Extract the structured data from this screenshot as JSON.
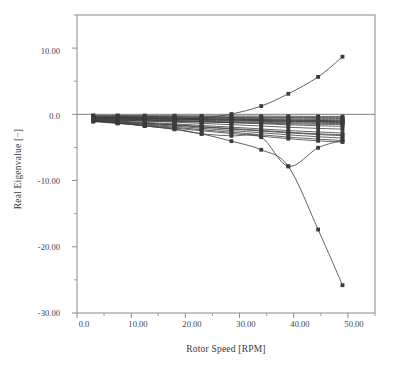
{
  "chart_data": {
    "type": "line",
    "title": "",
    "xlabel": "Rotor Speed [RPM]",
    "ylabel": "Real Eigenvalue [−]",
    "xlim": [
      0,
      55
    ],
    "ylim": [
      -30,
      15
    ],
    "grid": false,
    "legend": "none",
    "marker": "filled-square",
    "line_color": "#3b3b3b",
    "xticks": [
      0,
      10,
      20,
      30,
      40,
      50
    ],
    "xtick_labels": [
      "0.0",
      "10.00",
      "20.00",
      "30.00",
      "40.00",
      "50.00"
    ],
    "yticks": [
      10,
      0,
      -10,
      -20,
      -30
    ],
    "ytick_labels": [
      "10.00",
      "0.0",
      "-10.00",
      "-20.00",
      "-30.00"
    ],
    "minor_ytick_step": 5,
    "minor_xtick_step": 5,
    "x": [
      3,
      7.5,
      12.5,
      18,
      23,
      28.5,
      34,
      39,
      44.5,
      49
    ],
    "series": [
      {
        "name": "mode-1-unstable-branch",
        "values": [
          -0.45,
          -0.52,
          -0.6,
          -0.7,
          -0.55,
          0.05,
          1.25,
          3.1,
          5.65,
          8.7
        ]
      },
      {
        "name": "mode-2-divergent-branch",
        "values": [
          -0.95,
          -1.3,
          -1.75,
          -2.25,
          -2.95,
          -4.05,
          -5.35,
          -7.85,
          -17.4,
          -25.8
        ]
      },
      {
        "name": "mode-3-recovering-branch",
        "values": [
          -0.95,
          -1.3,
          -1.75,
          -2.25,
          -2.95,
          -3.25,
          -3.45,
          -7.85,
          -5.05,
          -3.95
        ]
      },
      {
        "name": "mode-4",
        "values": [
          -0.3,
          -0.33,
          -0.36,
          -0.4,
          -0.44,
          -0.48,
          -0.52,
          -0.56,
          -0.6,
          -0.62
        ]
      },
      {
        "name": "mode-5",
        "values": [
          -0.38,
          -0.42,
          -0.46,
          -0.5,
          -0.55,
          -0.6,
          -0.66,
          -0.72,
          -0.78,
          -0.82
        ]
      },
      {
        "name": "mode-6",
        "values": [
          -0.48,
          -0.52,
          -0.57,
          -0.62,
          -0.68,
          -0.74,
          -0.8,
          -0.87,
          -0.93,
          -0.97
        ]
      },
      {
        "name": "mode-7",
        "values": [
          -0.58,
          -0.63,
          -0.68,
          -0.74,
          -0.8,
          -0.86,
          -0.93,
          -1.0,
          -1.06,
          -1.1
        ]
      },
      {
        "name": "mode-8",
        "values": [
          -0.68,
          -0.73,
          -0.79,
          -0.85,
          -0.92,
          -0.99,
          -1.06,
          -1.13,
          -1.2,
          -1.25
        ]
      },
      {
        "name": "mode-9",
        "values": [
          -0.78,
          -0.84,
          -0.9,
          -0.97,
          -1.04,
          -1.12,
          -1.2,
          -1.28,
          -1.35,
          -1.4
        ]
      },
      {
        "name": "mode-10",
        "values": [
          -0.88,
          -0.94,
          -1.01,
          -1.08,
          -1.16,
          -1.25,
          -1.33,
          -1.42,
          -1.5,
          -1.55
        ]
      },
      {
        "name": "mode-11",
        "values": [
          -0.25,
          -0.28,
          -0.31,
          -0.34,
          -0.37,
          -0.4,
          -0.43,
          -0.46,
          -0.49,
          -0.51
        ]
      },
      {
        "name": "mode-12",
        "values": [
          -0.15,
          -0.17,
          -0.19,
          -0.21,
          -0.23,
          -0.25,
          -0.27,
          -0.29,
          -0.31,
          -0.33
        ]
      },
      {
        "name": "mode-13",
        "values": [
          -0.6,
          -0.7,
          -0.82,
          -0.96,
          -1.1,
          -1.26,
          -1.42,
          -1.58,
          -1.72,
          -1.82
        ]
      },
      {
        "name": "mode-14",
        "values": [
          -0.7,
          -0.85,
          -1.0,
          -1.18,
          -1.36,
          -1.56,
          -1.76,
          -1.95,
          -2.12,
          -2.24
        ]
      },
      {
        "name": "mode-15",
        "values": [
          -0.9,
          -1.1,
          -1.32,
          -1.58,
          -1.85,
          -2.14,
          -2.42,
          -2.7,
          -2.94,
          -3.1
        ]
      },
      {
        "name": "mode-16",
        "values": [
          -1.0,
          -1.22,
          -1.48,
          -1.78,
          -2.1,
          -2.45,
          -2.78,
          -3.1,
          -3.38,
          -3.58
        ]
      },
      {
        "name": "mode-17",
        "values": [
          -1.05,
          -1.3,
          -1.6,
          -1.95,
          -2.32,
          -2.7,
          -3.08,
          -3.44,
          -3.74,
          -3.95
        ]
      },
      {
        "name": "mode-18",
        "values": [
          -1.1,
          -1.38,
          -1.7,
          -2.08,
          -2.48,
          -2.9,
          -3.3,
          -3.68,
          -4.0,
          -4.18
        ]
      },
      {
        "name": "mode-19",
        "values": [
          -0.95,
          -1.15,
          -1.38,
          -1.64,
          -1.92,
          -2.22,
          -2.52,
          -2.8,
          -3.05,
          -3.22
        ]
      },
      {
        "name": "mode-20",
        "values": [
          -0.85,
          -1.02,
          -1.22,
          -1.44,
          -1.68,
          -1.94,
          -2.2,
          -2.45,
          -2.66,
          -2.82
        ]
      },
      {
        "name": "mode-21",
        "values": [
          -0.42,
          -0.47,
          -0.53,
          -0.59,
          -0.66,
          -0.73,
          -0.8,
          -0.87,
          -0.94,
          -0.99
        ]
      },
      {
        "name": "mode-22",
        "values": [
          -0.52,
          -0.58,
          -0.64,
          -0.71,
          -0.79,
          -0.87,
          -0.95,
          -1.04,
          -1.12,
          -1.18
        ]
      }
    ]
  },
  "axes": {
    "x_title": "Rotor Speed [RPM]",
    "y_title": "Real Eigenvalue [−]"
  },
  "x_tick_labels": [
    "0.0",
    "10.00",
    "20.00",
    "30.00",
    "40.00",
    "50.00"
  ],
  "y_tick_labels": [
    "10.00",
    "0.0",
    "-10.00",
    "-20.00",
    "-30.00"
  ]
}
